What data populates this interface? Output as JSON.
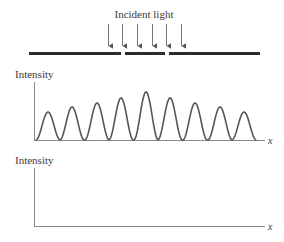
{
  "incident_label": "Incident light",
  "barrier": {
    "color": "#2b2b2b",
    "segments": [
      [
        29,
        121
      ],
      [
        125,
        165
      ],
      [
        169,
        260
      ]
    ],
    "y": 53.5
  },
  "arrows": {
    "x": [
      108,
      122,
      137,
      152,
      166,
      181
    ],
    "y_top": 24,
    "y_bottom": 50
  },
  "graph1": {
    "ylabel": "Intensity",
    "xlabel": "x",
    "peaks_x": [
      48,
      72,
      97,
      121,
      146,
      170,
      195,
      220,
      244
    ],
    "peaks_y": [
      112,
      107,
      103,
      98,
      92,
      98,
      103,
      107,
      112
    ]
  },
  "graph2": {
    "ylabel": "Intensity",
    "xlabel": "x"
  },
  "colors": {
    "axis": "#8a8a8a",
    "curve": "#555555",
    "text": "#3a3a3a"
  }
}
